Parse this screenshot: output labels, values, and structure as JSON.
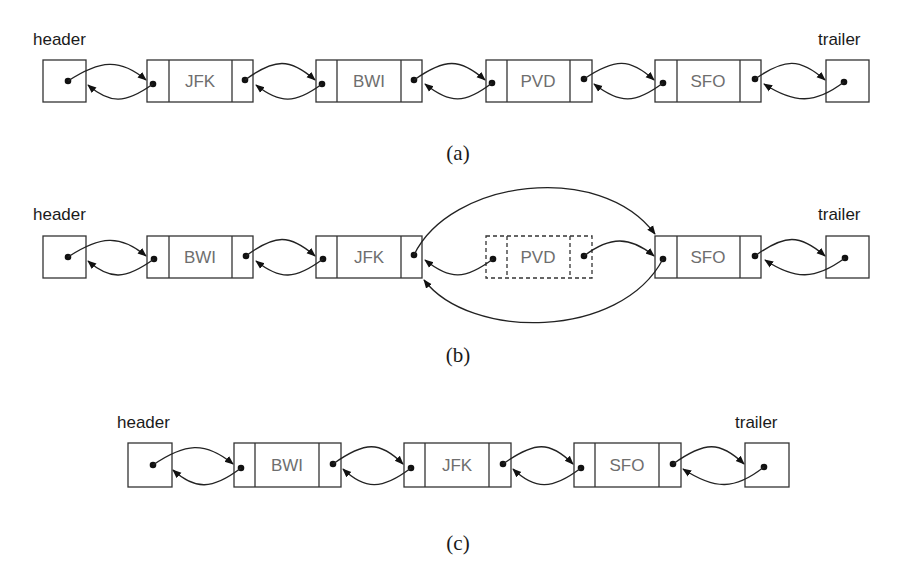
{
  "figure": {
    "panels": [
      {
        "id": "a",
        "caption": "(a)",
        "header_label": "header",
        "trailer_label": "trailer",
        "nodes": [
          {
            "element": "JFK",
            "removed": false
          },
          {
            "element": "BWI",
            "removed": false
          },
          {
            "element": "PVD",
            "removed": false
          },
          {
            "element": "SFO",
            "removed": false
          }
        ]
      },
      {
        "id": "b",
        "caption": "(b)",
        "header_label": "header",
        "trailer_label": "trailer",
        "nodes": [
          {
            "element": "BWI",
            "removed": false
          },
          {
            "element": "JFK",
            "removed": false
          },
          {
            "element": "PVD",
            "removed": true
          },
          {
            "element": "SFO",
            "removed": false
          }
        ]
      },
      {
        "id": "c",
        "caption": "(c)",
        "header_label": "header",
        "trailer_label": "trailer",
        "nodes": [
          {
            "element": "BWI",
            "removed": false
          },
          {
            "element": "JFK",
            "removed": false
          },
          {
            "element": "SFO",
            "removed": false
          }
        ]
      }
    ]
  }
}
